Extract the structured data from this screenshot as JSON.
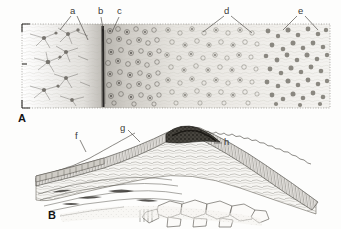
{
  "figure": {
    "background_color": "#fdfdfc",
    "ink_color": "#3a3a38",
    "panels": [
      {
        "id": "A",
        "letter": "A",
        "caption_letter_position": {
          "x": 18,
          "y": 115
        },
        "frame": {
          "style": "dotted",
          "x": 22,
          "y": 24,
          "width": 308,
          "height": 84,
          "corner_ticks": true
        },
        "description": "Transverse histological section showing a gradient of cell density from branching stellate cells at left through a dark basal line to progressively denser rounded cells at right",
        "labels": [
          {
            "key": "a",
            "text": "a",
            "x": 73,
            "y": 10,
            "leader": "two-pronged",
            "targets": [
              [
                60,
                30
              ],
              [
                88,
                40
              ]
            ],
            "refers_to": "branching stellate cells"
          },
          {
            "key": "b",
            "text": "b",
            "x": 100,
            "y": 10,
            "leader": "single",
            "targets": [
              [
                103,
                30
              ]
            ],
            "refers_to": "dark vertical basal line"
          },
          {
            "key": "c",
            "text": "c",
            "x": 119,
            "y": 10,
            "leader": "single",
            "targets": [
              [
                112,
                32
              ]
            ],
            "refers_to": "dense darkly stained cell zone"
          },
          {
            "key": "d",
            "text": "d",
            "x": 227,
            "y": 10,
            "leader": "two-pronged",
            "targets": [
              [
                203,
                32
              ],
              [
                252,
                32
              ]
            ],
            "refers_to": "medium density cell region"
          },
          {
            "key": "e",
            "text": "e",
            "x": 300,
            "y": 10,
            "leader": "two-pronged",
            "targets": [
              [
                283,
                30
              ],
              [
                318,
                30
              ]
            ],
            "refers_to": "scattered round cells at right margin"
          }
        ]
      },
      {
        "id": "B",
        "letter": "B",
        "caption_letter_position": {
          "x": 48,
          "y": 212
        },
        "description": "Oblique section through an arched ridge of tissue with a columnar palisade layer, a dark crest, and large vacuolated polygonal cells beneath",
        "labels": [
          {
            "key": "f",
            "text": "f",
            "x": 77,
            "y": 135,
            "leader": "single",
            "targets": [
              [
                86,
                152
              ]
            ],
            "refers_to": "thin outer epithelial layer"
          },
          {
            "key": "g",
            "text": "g",
            "x": 122,
            "y": 127,
            "leader": "single",
            "targets": [
              [
                140,
                142
              ]
            ],
            "refers_to": "upper ridge surface"
          },
          {
            "key": "h",
            "text": "h",
            "x": 227,
            "y": 141,
            "leader": "single",
            "targets": [
              [
                214,
                143
              ]
            ],
            "refers_to": "columnar palisade layer with scalloped margin"
          }
        ]
      }
    ]
  }
}
